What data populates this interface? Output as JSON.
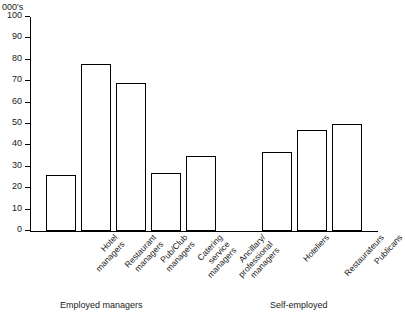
{
  "chart_data": {
    "type": "bar",
    "title": "",
    "subtitle": "",
    "xlabel": "",
    "ylabel": "000's",
    "ylim": [
      0,
      100
    ],
    "ytick_values": [
      0,
      10,
      20,
      30,
      40,
      50,
      60,
      70,
      80,
      90,
      100
    ],
    "ytick_labels": [
      "0",
      "10",
      "20",
      "30",
      "40",
      "50",
      "60",
      "70",
      "80",
      "90",
      "100"
    ],
    "grid": false,
    "legend": "none",
    "bar_style": {
      "fill": "#ffffff",
      "outline": "#000000"
    },
    "groups": [
      {
        "name": "Employed managers",
        "categories": [
          "Hotel managers",
          "Restaurant managers",
          "Pub/Club managers",
          "Catering service managers",
          "Ancillary/professional managers"
        ],
        "category_lines": [
          [
            "Hotel",
            "managers"
          ],
          [
            "Restaurant",
            "managers"
          ],
          [
            "Pub/Club",
            "managers"
          ],
          [
            "Catering",
            "service",
            "managers"
          ],
          [
            "Ancillary/",
            "professional",
            "managers"
          ]
        ],
        "values": [
          26,
          78,
          69,
          27,
          35
        ]
      },
      {
        "name": "Self-employed",
        "categories": [
          "Hoteliers",
          "Restaurateurs",
          "Publicans"
        ],
        "category_lines": [
          [
            "Hoteliers"
          ],
          [
            "Restaurateurs"
          ],
          [
            "Publicans"
          ]
        ],
        "values": [
          37,
          47,
          50
        ]
      }
    ]
  },
  "axis": {
    "unit_caption": "000's"
  },
  "captions": {
    "group_left": "Employed managers",
    "group_right": "Self-employed"
  }
}
